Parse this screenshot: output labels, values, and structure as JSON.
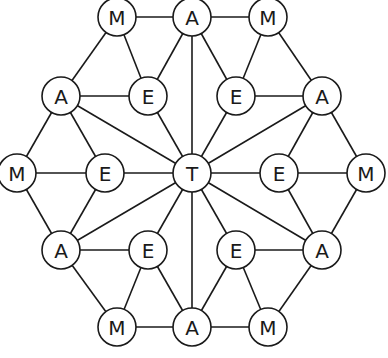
{
  "diagram": {
    "title": "",
    "node_radius": 19,
    "colors": {
      "stroke": "#1a1a1a",
      "fill": "#ffffff",
      "text": "#1a1a1a"
    },
    "nodes": [
      {
        "id": "m1",
        "label": "M",
        "x": 117,
        "y": 17
      },
      {
        "id": "a1",
        "label": "A",
        "x": 192,
        "y": 17
      },
      {
        "id": "m2",
        "label": "M",
        "x": 268,
        "y": 17
      },
      {
        "id": "a2",
        "label": "A",
        "x": 61,
        "y": 96
      },
      {
        "id": "e1",
        "label": "E",
        "x": 148,
        "y": 96
      },
      {
        "id": "e2",
        "label": "E",
        "x": 236,
        "y": 96
      },
      {
        "id": "a3",
        "label": "A",
        "x": 322,
        "y": 96
      },
      {
        "id": "m3",
        "label": "M",
        "x": 17,
        "y": 173
      },
      {
        "id": "e3",
        "label": "E",
        "x": 105,
        "y": 173
      },
      {
        "id": "t",
        "label": "T",
        "x": 192,
        "y": 173
      },
      {
        "id": "e4",
        "label": "E",
        "x": 279,
        "y": 173
      },
      {
        "id": "m4",
        "label": "M",
        "x": 366,
        "y": 173
      },
      {
        "id": "a4",
        "label": "A",
        "x": 61,
        "y": 250
      },
      {
        "id": "e5",
        "label": "E",
        "x": 148,
        "y": 250
      },
      {
        "id": "e6",
        "label": "E",
        "x": 236,
        "y": 250
      },
      {
        "id": "a5",
        "label": "A",
        "x": 322,
        "y": 250
      },
      {
        "id": "m5",
        "label": "M",
        "x": 117,
        "y": 327
      },
      {
        "id": "a6",
        "label": "A",
        "x": 192,
        "y": 327
      },
      {
        "id": "m6",
        "label": "M",
        "x": 268,
        "y": 327
      }
    ],
    "edges": [
      [
        "m1",
        "a1"
      ],
      [
        "a1",
        "m2"
      ],
      [
        "m1",
        "a2"
      ],
      [
        "m1",
        "e1"
      ],
      [
        "a1",
        "e1"
      ],
      [
        "a1",
        "e2"
      ],
      [
        "a1",
        "t"
      ],
      [
        "m2",
        "e2"
      ],
      [
        "m2",
        "a3"
      ],
      [
        "a2",
        "e1"
      ],
      [
        "e2",
        "a3"
      ],
      [
        "a2",
        "m3"
      ],
      [
        "a2",
        "e3"
      ],
      [
        "a2",
        "t"
      ],
      [
        "e1",
        "t"
      ],
      [
        "e2",
        "t"
      ],
      [
        "a3",
        "t"
      ],
      [
        "a3",
        "e4"
      ],
      [
        "a3",
        "m4"
      ],
      [
        "m3",
        "e3"
      ],
      [
        "e3",
        "t"
      ],
      [
        "t",
        "e4"
      ],
      [
        "e4",
        "m4"
      ],
      [
        "m3",
        "a4"
      ],
      [
        "e3",
        "a4"
      ],
      [
        "t",
        "a4"
      ],
      [
        "t",
        "e5"
      ],
      [
        "t",
        "e6"
      ],
      [
        "t",
        "a6"
      ],
      [
        "t",
        "a5"
      ],
      [
        "e4",
        "a5"
      ],
      [
        "m4",
        "a5"
      ],
      [
        "a4",
        "e5"
      ],
      [
        "e6",
        "a5"
      ],
      [
        "a4",
        "m5"
      ],
      [
        "e5",
        "m5"
      ],
      [
        "e5",
        "a6"
      ],
      [
        "e6",
        "a6"
      ],
      [
        "e6",
        "m6"
      ],
      [
        "a5",
        "m6"
      ],
      [
        "m5",
        "a6"
      ],
      [
        "a6",
        "m6"
      ]
    ]
  }
}
